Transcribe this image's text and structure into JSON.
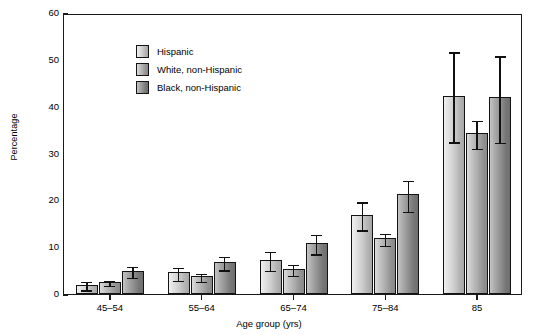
{
  "chart_data": {
    "type": "bar",
    "title": "",
    "xlabel": "Age group (yrs)",
    "ylabel": "Percentage",
    "ylim": [
      0,
      60
    ],
    "yticks": [
      0,
      10,
      20,
      30,
      40,
      50,
      60
    ],
    "ytick_labels": [
      "0",
      "10",
      "20",
      "30",
      "40",
      "50",
      "60"
    ],
    "grid": false,
    "legend_position": "top-left",
    "categories": [
      "45–54",
      "55–64",
      "65–74",
      "75–84",
      "85"
    ],
    "series": [
      {
        "name": "Hispanic",
        "color": "#cfcfcf",
        "values": [
          2.0,
          4.6,
          7.3,
          16.8,
          42.3
        ],
        "err_low": [
          1.2,
          3.3,
          5.4,
          14.0,
          32.8
        ],
        "err_high": [
          3.0,
          6.0,
          9.4,
          20.0,
          52.0
        ]
      },
      {
        "name": "White, non-Hispanic",
        "color": "#b0b0b0",
        "values": [
          2.6,
          3.9,
          5.4,
          11.9,
          34.3
        ],
        "err_low": [
          2.2,
          3.0,
          4.3,
          10.7,
          31.4
        ],
        "err_high": [
          3.2,
          4.8,
          6.6,
          13.3,
          37.4
        ]
      },
      {
        "name": "Black, non-Hispanic",
        "color": "#949494",
        "values": [
          5.0,
          6.9,
          10.9,
          21.3,
          42.0
        ],
        "err_low": [
          3.9,
          5.5,
          8.9,
          18.0,
          32.7
        ],
        "err_high": [
          6.2,
          8.4,
          13.1,
          24.6,
          51.2
        ]
      }
    ]
  },
  "legend": {
    "items": [
      {
        "label": "Hispanic"
      },
      {
        "label": "White, non-Hispanic"
      },
      {
        "label": "Black, non-Hispanic"
      }
    ]
  }
}
